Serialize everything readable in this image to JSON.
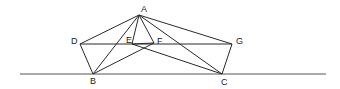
{
  "diagram": {
    "points": {
      "A": {
        "label": "A",
        "x": 139,
        "y": 15,
        "lx": 141,
        "ly": 5
      },
      "D": {
        "label": "D",
        "x": 80,
        "y": 44,
        "lx": 71,
        "ly": 37
      },
      "E": {
        "label": "E",
        "x": 132,
        "y": 44,
        "lx": 126,
        "ly": 36
      },
      "F": {
        "label": "F",
        "x": 154,
        "y": 43,
        "lx": 157,
        "ly": 37
      },
      "G": {
        "label": "G",
        "x": 232,
        "y": 44,
        "lx": 236,
        "ly": 37
      },
      "B": {
        "label": "B",
        "x": 93,
        "y": 74,
        "lx": 90,
        "ly": 77
      },
      "C": {
        "label": "C",
        "x": 222,
        "y": 74,
        "lx": 221,
        "ly": 78
      }
    },
    "baseline": {
      "x1": 20,
      "y1": 74,
      "x2": 326,
      "y2": 74
    },
    "segments": [
      [
        "A",
        "D"
      ],
      [
        "A",
        "E"
      ],
      [
        "A",
        "F"
      ],
      [
        "A",
        "G"
      ],
      [
        "A",
        "B"
      ],
      [
        "A",
        "C"
      ],
      [
        "D",
        "G"
      ],
      [
        "D",
        "B"
      ],
      [
        "G",
        "C"
      ],
      [
        "E",
        "F"
      ],
      [
        "E",
        "C"
      ],
      [
        "F",
        "B"
      ]
    ]
  }
}
